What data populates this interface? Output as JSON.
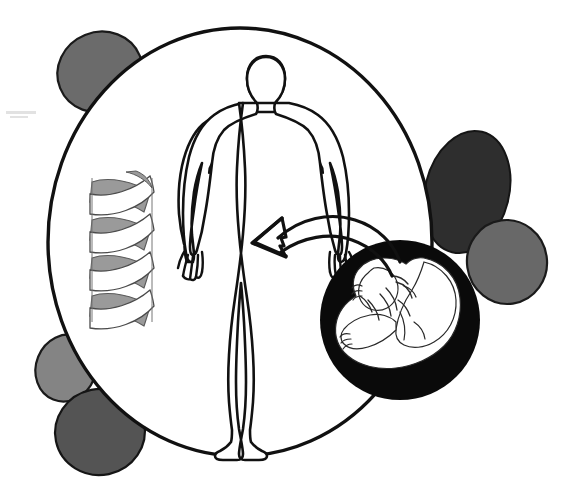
{
  "figure": {
    "title": "Genetics and prenatal development concept diagram",
    "background_color": "#ffffff",
    "stroke_color": "#111111"
  },
  "main_circle": {
    "name": "main circle",
    "cx": 240,
    "cy": 242,
    "rx": 192,
    "ry": 214,
    "fill": "#ffffff",
    "stroke": "#111111",
    "stroke_width": 3.4
  },
  "blobs": [
    {
      "id": "blob-top-left",
      "label": "top left shaded blob",
      "cx": 100,
      "cy": 72,
      "rx": 43,
      "ry": 40,
      "rotate": -22,
      "fill": "#6b6b6b",
      "stroke": "#1a1a1a"
    },
    {
      "id": "blob-right-upper",
      "label": "right upper dark blob",
      "cx": 467,
      "cy": 192,
      "rx": 42,
      "ry": 62,
      "rotate": 14,
      "fill": "#2e2e2e",
      "stroke": "#151515"
    },
    {
      "id": "blob-right-lower",
      "label": "right lower gray blob",
      "cx": 507,
      "cy": 262,
      "rx": 40,
      "ry": 42,
      "rotate": -8,
      "fill": "#686868",
      "stroke": "#1a1a1a"
    },
    {
      "id": "blob-bottom-left-upper",
      "label": "bottom left light blob",
      "cx": 66,
      "cy": 368,
      "rx": 30,
      "ry": 34,
      "rotate": 22,
      "fill": "#848484",
      "stroke": "#1a1a1a"
    },
    {
      "id": "blob-bottom-left-lower",
      "label": "bottom left dark blob",
      "cx": 100,
      "cy": 432,
      "rx": 45,
      "ry": 43,
      "rotate": -12,
      "fill": "#545454",
      "stroke": "#151515"
    }
  ],
  "human_figure": {
    "label": "human body outline",
    "fill": "#ffffff",
    "stroke": "#111111",
    "stroke_width": 2.6
  },
  "dna_helix": {
    "label": "DNA double helix ribbon",
    "front_ribbon_fill": "#ffffff",
    "back_ribbon_fill": "#9a9a9a",
    "stroke": "#4a4a4a",
    "turns": 4,
    "center_x": 120,
    "top_y": 172,
    "bottom_y": 322
  },
  "fetus_circle": {
    "label": "black circle containing fetus",
    "cx": 400,
    "cy": 320,
    "r": 80,
    "fill": "#0a0a0a",
    "fetus_fill": "#ffffff",
    "fetus_stroke": "#2a2a2a"
  },
  "arrow": {
    "label": "curved arrow from fetus to body",
    "stroke": "#111111",
    "stroke_width": 3.2,
    "direction": "right-to-left",
    "from": "fetus circle",
    "to": "human figure torso"
  },
  "artifact": {
    "label": "faint scan artifact mark",
    "x": 6,
    "y": 112,
    "width": 28,
    "height": 4,
    "color": "#e2e2e2"
  }
}
